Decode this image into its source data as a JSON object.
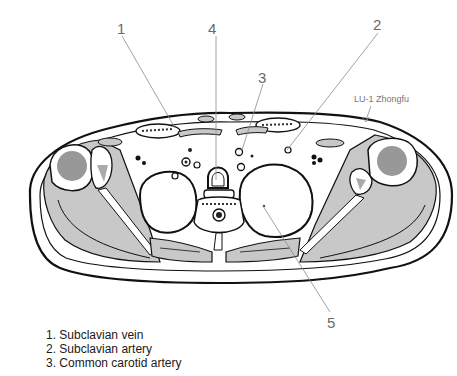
{
  "figure": {
    "callouts": [
      {
        "number": "1",
        "x": 117,
        "y": 22
      },
      {
        "number": "2",
        "x": 375,
        "y": 18
      },
      {
        "number": "3",
        "x": 259,
        "y": 71
      },
      {
        "number": "4",
        "x": 209,
        "y": 22
      },
      {
        "number": "5",
        "x": 328,
        "y": 316
      }
    ],
    "acupoint_label": "LU-1 Zhongfu",
    "legend": [
      "1. Subclavian vein",
      "2. Subclavian artery",
      "3. Common carotid artery"
    ],
    "colors": {
      "outline": "#111111",
      "muscle_fill": "#c8c8c8",
      "bone_fill": "#ffffff",
      "leader_line": "#8a8a8a",
      "label_text": "#6a6a6a"
    }
  }
}
